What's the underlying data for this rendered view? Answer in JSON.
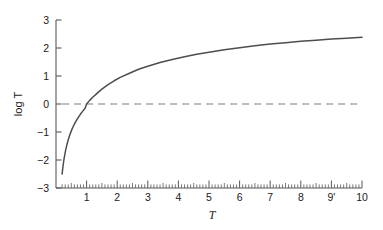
{
  "chart_data": {
    "type": "line",
    "title": "",
    "xlabel": "T",
    "ylabel": "log T",
    "xlim": [
      0.15,
      10
    ],
    "ylim": [
      -3,
      3
    ],
    "grid": false,
    "legend": null,
    "x_ticks": [
      {
        "value": 1,
        "label": "1"
      },
      {
        "value": 2,
        "label": "2"
      },
      {
        "value": 3,
        "label": "3"
      },
      {
        "value": 4,
        "label": "4"
      },
      {
        "value": 5,
        "label": "5"
      },
      {
        "value": 6,
        "label": "6"
      },
      {
        "value": 7,
        "label": "7"
      },
      {
        "value": 8,
        "label": "8"
      },
      {
        "value": 9,
        "label": "9'"
      },
      {
        "value": 10,
        "label": "10"
      }
    ],
    "x_minor_tick_step": 0.1,
    "y_ticks": [
      {
        "value": 3,
        "label": "3"
      },
      {
        "value": 2,
        "label": "2"
      },
      {
        "value": 1,
        "label": "1"
      },
      {
        "value": 0,
        "label": "0"
      },
      {
        "value": -1,
        "label": "−1"
      },
      {
        "value": -2,
        "label": "−2"
      },
      {
        "value": -3,
        "label": "−3"
      }
    ],
    "series": [
      {
        "name": "log T",
        "style": "solid",
        "color": "#4d4d52",
        "points": [
          [
            0.2,
            -2.5
          ],
          [
            0.22,
            -2.3
          ],
          [
            0.25,
            -2.05
          ],
          [
            0.28,
            -1.85
          ],
          [
            0.32,
            -1.62
          ],
          [
            0.36,
            -1.44
          ],
          [
            0.4,
            -1.28
          ],
          [
            0.45,
            -1.11
          ],
          [
            0.5,
            -0.96
          ],
          [
            0.55,
            -0.83
          ],
          [
            0.6,
            -0.72
          ],
          [
            0.65,
            -0.62
          ],
          [
            0.7,
            -0.53
          ],
          [
            0.75,
            -0.44
          ],
          [
            0.8,
            -0.36
          ],
          [
            0.85,
            -0.29
          ],
          [
            0.9,
            -0.22
          ],
          [
            0.95,
            -0.15
          ],
          [
            1.0,
            0.0
          ],
          [
            1.1,
            0.13
          ],
          [
            1.2,
            0.24
          ],
          [
            1.35,
            0.39
          ],
          [
            1.5,
            0.53
          ],
          [
            1.7,
            0.69
          ],
          [
            1.9,
            0.83
          ],
          [
            2.1,
            0.95
          ],
          [
            2.4,
            1.1
          ],
          [
            2.7,
            1.24
          ],
          [
            3.0,
            1.35
          ],
          [
            3.4,
            1.48
          ],
          [
            3.8,
            1.59
          ],
          [
            4.2,
            1.69
          ],
          [
            4.6,
            1.78
          ],
          [
            5.0,
            1.85
          ],
          [
            5.5,
            1.94
          ],
          [
            6.0,
            2.01
          ],
          [
            6.5,
            2.08
          ],
          [
            7.0,
            2.14
          ],
          [
            7.5,
            2.19
          ],
          [
            8.0,
            2.24
          ],
          [
            8.5,
            2.28
          ],
          [
            9.0,
            2.32
          ],
          [
            9.5,
            2.35
          ],
          [
            10.0,
            2.38
          ]
        ]
      },
      {
        "name": "zero-reference",
        "style": "dashed",
        "color": "#a8a8ad",
        "constant_y": 0,
        "x_from": 0.2,
        "x_to": 10.0
      }
    ]
  },
  "axes": {
    "y_axis_label": "log T",
    "x_axis_label": "T"
  },
  "colors": {
    "curve": "#4d4d52",
    "dashed": "#a8a8ad",
    "axis": "#58585c",
    "text": "#1a1a1a",
    "background": "#ffffff"
  }
}
